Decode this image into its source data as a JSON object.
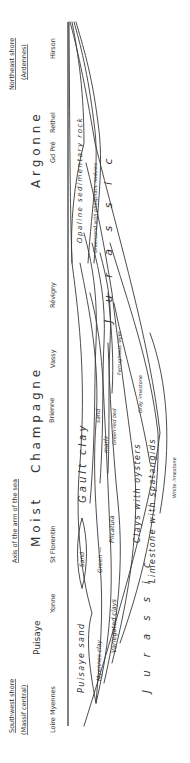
{
  "figure": {
    "orientation": "rotated 90 degrees counter-clockwise",
    "shores": {
      "southwest": {
        "title": "Southwest shore",
        "subtitle": "(Massif central)"
      },
      "northeast": {
        "title": "Northeast shore",
        "subtitle": "(Ardennes)"
      },
      "axis": "Axis of the arm of the sea"
    },
    "regions": [
      {
        "id": "puisaye",
        "label": "Puisaye"
      },
      {
        "id": "moist",
        "label": "M o i s t"
      },
      {
        "id": "champagne",
        "label": "C h a m p a g n e"
      },
      {
        "id": "argonne",
        "label": "A r g o n n e"
      }
    ],
    "places": [
      {
        "id": "loire-myennes",
        "label": "Loire Myennes"
      },
      {
        "id": "yonne",
        "label": "Yonne"
      },
      {
        "id": "st-florentin",
        "label": "St Florentin"
      },
      {
        "id": "brienne",
        "label": "Brienne"
      },
      {
        "id": "vassy",
        "label": "Vassy"
      },
      {
        "id": "revigny",
        "label": "Révigny"
      },
      {
        "id": "gd-pre",
        "label": "Gd Pré"
      },
      {
        "id": "rethel",
        "label": "Rethel"
      },
      {
        "id": "hirson",
        "label": "Hirson"
      }
    ],
    "strata_labels": {
      "puisaye_sand": "Puisaye  sand",
      "myennes_clay": "Myennes clay",
      "variegated_clays": "Variegated clays",
      "sand_lens": "Sand",
      "green": "Green  —",
      "plicatula": "Plicatula",
      "clays_with_oysters": "Clays  with  oysters",
      "limestone_with_spatangids": "Limestone  with  spatangids",
      "white_limestone": "White limestone",
      "gault_clay": "Gault      clay",
      "sand": "sand",
      "marls": "marls",
      "green_red_bed": "Green-red bed",
      "ferruginous": "Ferruginous layer",
      "gray_limestone": "Gray limestone",
      "opaline": "Opaline   sedimentary   rock",
      "greensand_nodules": "Greensand  with  phosphatic  nodules",
      "jurassic_sw": "J u r a s s i c",
      "jurassic_ne": "J u r a s s i c"
    }
  }
}
